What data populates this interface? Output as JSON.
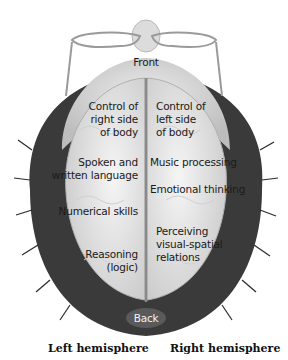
{
  "diagram": {
    "front_label": "Front",
    "back_label": "Back",
    "hemispheres": {
      "left": "Left hemisphere",
      "right": "Right hemisphere"
    },
    "left_functions": [
      {
        "line1": "Control of",
        "line2": "right side",
        "line3": "of body"
      },
      {
        "line1": "Spoken and",
        "line2": "written language"
      },
      {
        "line1": "Numerical skills"
      },
      {
        "line1": "Reasoning",
        "line2": "(logic)"
      }
    ],
    "right_functions": [
      {
        "line1": "Control of",
        "line2": "left side",
        "line3": "of body"
      },
      {
        "line1": "Music processing"
      },
      {
        "line1": "Emotional thinking"
      },
      {
        "line1": "Perceiving",
        "line2": "visual-spatial",
        "line3": "relations"
      }
    ],
    "colors": {
      "hair": "#3a3a3a",
      "scalp": "#d9d9d9",
      "brain": "#e6e6e6",
      "fissure": "#8a8a8a",
      "text": "#1a1a1a"
    }
  }
}
